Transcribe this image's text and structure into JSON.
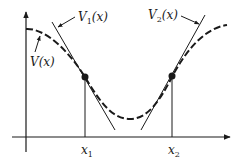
{
  "diagram": {
    "title": "",
    "curve": {
      "label": "V(x)",
      "label_main": "V",
      "label_arg": "(x)",
      "style": "dashed"
    },
    "tangents": [
      {
        "label": "V₁(x)",
        "label_main": "V",
        "label_sub": "1",
        "label_arg": "(x)",
        "at": "x1"
      },
      {
        "label": "V₂(x)",
        "label_main": "V",
        "label_sub": "2",
        "label_arg": "(x)",
        "at": "x2"
      }
    ],
    "points": [
      {
        "label": "x₁",
        "label_main": "x",
        "label_sub": "1"
      },
      {
        "label": "x₂",
        "label_main": "x",
        "label_sub": "2"
      }
    ],
    "axes": {
      "x_arrow": true,
      "y_arrow": true
    },
    "colors": {
      "ink": "#1a1a1a",
      "background": "#ffffff"
    }
  }
}
